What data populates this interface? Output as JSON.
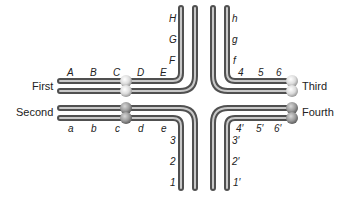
{
  "diagram": {
    "type": "chromosome-pairing-cross",
    "chromosomes": [
      {
        "name": "First",
        "loci": [
          "A",
          "B",
          "C",
          "D",
          "E",
          "F",
          "G",
          "H"
        ]
      },
      {
        "name": "Second",
        "loci": [
          "a",
          "b",
          "c",
          "d",
          "e",
          "3",
          "2",
          "1"
        ]
      },
      {
        "name": "Third",
        "loci": [
          "h",
          "g",
          "f",
          "4",
          "5",
          "6"
        ]
      },
      {
        "name": "Fourth",
        "loci": [
          "1′",
          "2′",
          "3′",
          "4′",
          "5′",
          "6′"
        ]
      }
    ],
    "labels": {
      "first": "First",
      "second": "Second",
      "third": "Third",
      "fourth": "Fourth"
    },
    "top_left_horizontal": [
      "A",
      "B",
      "C",
      "D",
      "E"
    ],
    "top_left_vertical": [
      "H",
      "G",
      "F"
    ],
    "top_right_vertical": [
      "h",
      "g",
      "f"
    ],
    "top_right_horizontal": [
      "4",
      "5",
      "6"
    ],
    "bottom_left_horizontal": [
      "a",
      "b",
      "c",
      "d",
      "e"
    ],
    "bottom_left_vertical": [
      "3",
      "2",
      "1"
    ],
    "bottom_right_horizontal": [
      "4′",
      "5′",
      "6′"
    ],
    "bottom_right_vertical": [
      "3′",
      "2′",
      "1′"
    ],
    "colors": {
      "tube_outer": "#555555",
      "tube_inner": "#bdbdbd",
      "centromere_light": "#e6e6e6",
      "centromere_dark": "#8a8a8a",
      "text": "#222222"
    }
  }
}
